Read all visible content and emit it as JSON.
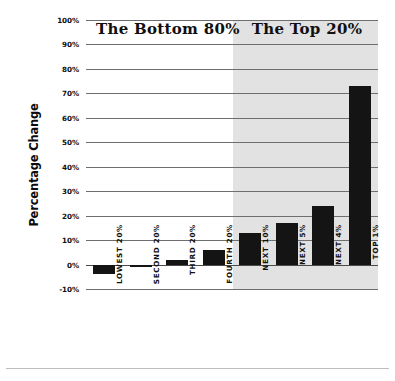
{
  "chart_data": {
    "type": "bar",
    "title": "",
    "xlabel": "",
    "ylabel": "Percentage Change",
    "ylim": [
      -10,
      100
    ],
    "ytick_step": 10,
    "grid": true,
    "legend": "none",
    "categories": [
      "LOWEST 20%",
      "SECOND 20%",
      "THIRD 20%",
      "FOURTH 20%",
      "NEXT 10%",
      "NEXT 5%",
      "NEXT 4%",
      "TOP 1%"
    ],
    "values": [
      -4,
      -1,
      2,
      6,
      13,
      17,
      24,
      73
    ],
    "ytick_labels": [
      "100%",
      "90%",
      "80%",
      "70%",
      "60%",
      "50%",
      "40%",
      "30%",
      "20%",
      "10%",
      "0%",
      "-10%"
    ],
    "ytick_values": [
      100,
      90,
      80,
      70,
      60,
      50,
      40,
      30,
      20,
      10,
      0,
      -10
    ],
    "annotations": [
      {
        "text": "The Bottom 80%",
        "spans_categories": [
          "LOWEST 20%",
          "FOURTH 20%"
        ],
        "shaded": false
      },
      {
        "text": "The Top 20%",
        "spans_categories": [
          "NEXT 10%",
          "TOP 1%"
        ],
        "shaded": true
      }
    ],
    "colors": {
      "bar": "#141414",
      "shaded_region": "#e2e2e2",
      "gridline": "#6e6e6e",
      "background": "#ffffff",
      "text": "#101010"
    }
  },
  "axis": {
    "y_title": "Percentage Change"
  },
  "regions": {
    "bottom_label": "The Bottom 80%",
    "top_label": "The Top 20%"
  }
}
